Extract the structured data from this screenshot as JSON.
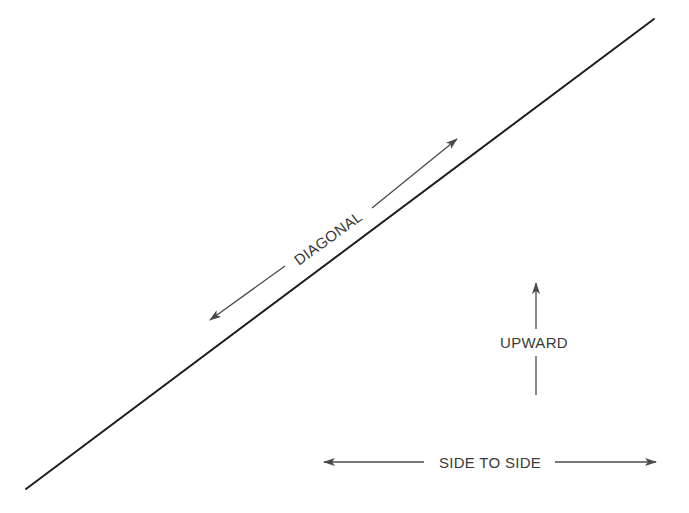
{
  "diagram": {
    "title": "",
    "colors": {
      "main_line": "#1e1e1e",
      "arrow": "#4a4a4a",
      "text": "#3a3a3a",
      "background": "#ffffff"
    },
    "main_line": {
      "from": [
        26,
        489
      ],
      "to": [
        654,
        19
      ]
    },
    "arrows": [
      {
        "id": "diagonal",
        "label": "DIAGONAL",
        "direction": "bidirectional",
        "from": [
          210,
          320
        ],
        "to": [
          457,
          139
        ],
        "label_center": [
          328,
          238
        ],
        "label_rotation_deg": -36.2
      },
      {
        "id": "upward",
        "label": "UPWARD",
        "direction": "up",
        "from": [
          536,
          395
        ],
        "to": [
          536,
          283
        ],
        "label_center": [
          536,
          342
        ]
      },
      {
        "id": "side-to-side",
        "label": "SIDE TO SIDE",
        "direction": "bidirectional",
        "from": [
          324,
          462
        ],
        "to": [
          656,
          462
        ],
        "label_center": [
          490,
          462
        ]
      }
    ]
  }
}
